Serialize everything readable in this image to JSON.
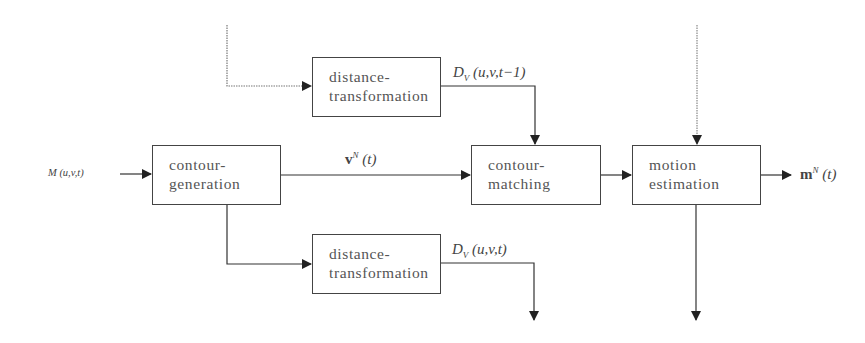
{
  "diagram": {
    "type": "block-diagram",
    "blocks": [
      {
        "id": "dt_top",
        "label": "distance-\ntransformation"
      },
      {
        "id": "contour_gen",
        "label": "contour-\ngeneration"
      },
      {
        "id": "contour_match",
        "label": "contour-\nmatching"
      },
      {
        "id": "motion_est",
        "label": "motion\nestimation"
      },
      {
        "id": "dt_bottom",
        "label": "distance-\ntransformation"
      }
    ],
    "signals": {
      "input": {
        "sym": "M",
        "args": "(u,v,t)"
      },
      "contour": {
        "sym": "v",
        "sup": "N",
        "args": "(t)"
      },
      "dist_prev": {
        "sym": "D",
        "sub": "V",
        "args": "(u,v,t−1)"
      },
      "dist_curr": {
        "sym": "D",
        "sub": "V",
        "args": "(u,v,t)"
      },
      "output": {
        "sym": "m",
        "sup": "N",
        "args": "(t)"
      }
    },
    "connections": [
      {
        "from": "feedback (dotted, from above)",
        "to": "dt_top"
      },
      {
        "from": "input",
        "to": "contour_gen"
      },
      {
        "from": "contour_gen",
        "to": "contour_match",
        "label": "v^N(t)"
      },
      {
        "from": "dt_top",
        "to": "contour_match",
        "label": "D_V(u,v,t-1)"
      },
      {
        "from": "contour_match",
        "to": "motion_est"
      },
      {
        "from": "feedback (dotted, from above)",
        "to": "motion_est"
      },
      {
        "from": "motion_est",
        "to": "output",
        "label": "m^N(t)"
      },
      {
        "from": "contour_gen",
        "to": "dt_bottom"
      },
      {
        "from": "dt_bottom",
        "to": "next stage (down)",
        "label": "D_V(u,v,t)"
      },
      {
        "from": "motion_est",
        "to": "next stage (down)"
      }
    ]
  }
}
